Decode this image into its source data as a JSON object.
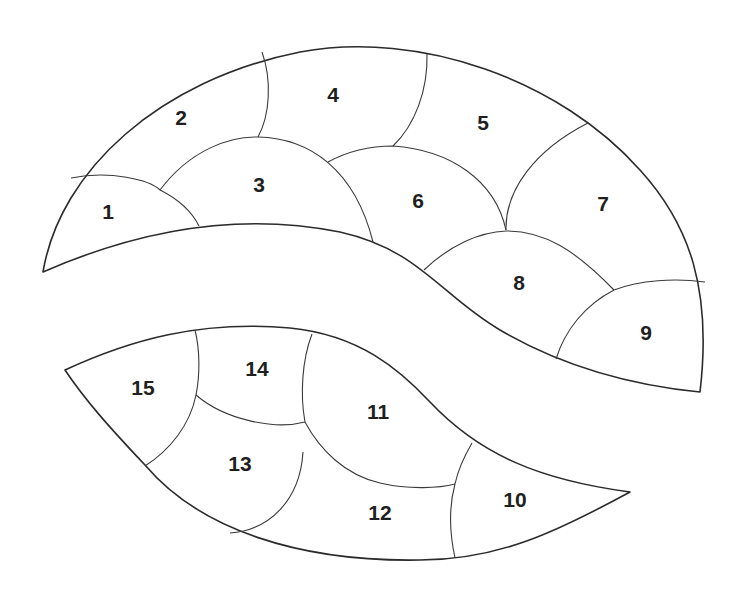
{
  "diagram": {
    "type": "quilt-pattern-pieces",
    "line_color": "#2b2b2b",
    "background": "#ffffff",
    "upper_section": {
      "pieces": [
        {
          "id": "1",
          "label": "1",
          "x": 108,
          "y": 213
        },
        {
          "id": "2",
          "label": "2",
          "x": 181,
          "y": 119
        },
        {
          "id": "3",
          "label": "3",
          "x": 259,
          "y": 186
        },
        {
          "id": "4",
          "label": "4",
          "x": 333,
          "y": 96
        },
        {
          "id": "5",
          "label": "5",
          "x": 483,
          "y": 124
        },
        {
          "id": "6",
          "label": "6",
          "x": 418,
          "y": 202
        },
        {
          "id": "7",
          "label": "7",
          "x": 603,
          "y": 205
        },
        {
          "id": "8",
          "label": "8",
          "x": 519,
          "y": 284
        },
        {
          "id": "9",
          "label": "9",
          "x": 646,
          "y": 334
        }
      ]
    },
    "lower_section": {
      "pieces": [
        {
          "id": "10",
          "label": "10",
          "x": 515,
          "y": 501
        },
        {
          "id": "11",
          "label": "11",
          "x": 378,
          "y": 413
        },
        {
          "id": "12",
          "label": "12",
          "x": 380,
          "y": 514
        },
        {
          "id": "13",
          "label": "13",
          "x": 240,
          "y": 465
        },
        {
          "id": "14",
          "label": "14",
          "x": 257,
          "y": 370
        },
        {
          "id": "15",
          "label": "15",
          "x": 143,
          "y": 389
        }
      ]
    }
  }
}
